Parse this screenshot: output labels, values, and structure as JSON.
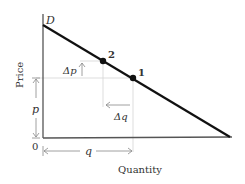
{
  "diagram": {
    "curve_label": "D",
    "y_axis_label": "Price",
    "x_axis_label": "Quantity",
    "origin_label": "0",
    "points": [
      {
        "label": "1",
        "x": 133,
        "y": 78
      },
      {
        "label": "2",
        "x": 103,
        "y": 61
      }
    ],
    "annotations": {
      "delta_p": "Δp",
      "delta_q": "Δq",
      "p": "p",
      "q": "q"
    },
    "colors": {
      "curve": "#111111",
      "axis": "#444444",
      "guide": "#cccccc",
      "arrow": "#888888"
    }
  }
}
